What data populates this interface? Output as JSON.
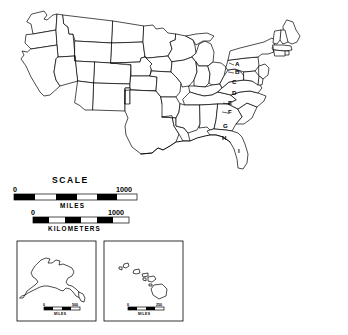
{
  "figure": {
    "background_color": "#ffffff",
    "line_color": "#000000"
  },
  "state_labels": [
    {
      "id": "A",
      "text": "A"
    },
    {
      "id": "B",
      "text": "B"
    },
    {
      "id": "C",
      "text": "C"
    },
    {
      "id": "D",
      "text": "D"
    },
    {
      "id": "E",
      "text": "E"
    },
    {
      "id": "F",
      "text": "F"
    },
    {
      "id": "G",
      "text": "G"
    },
    {
      "id": "H",
      "text": "H"
    },
    {
      "id": "I",
      "text": "I"
    }
  ],
  "scale": {
    "title": "SCALE",
    "miles": {
      "unit_label": "MILES",
      "min_label": "0",
      "max_label": "1000"
    },
    "kilometers": {
      "unit_label": "KILOMETERS",
      "min_label": "0",
      "max_label": "1000"
    }
  },
  "insets": [
    {
      "id": "alaska",
      "name": "Alaska",
      "scale": {
        "min_label": "0",
        "max_label": "500",
        "unit_label": "MILES"
      }
    },
    {
      "id": "hawaii",
      "name": "Hawaii",
      "scale": {
        "min_label": "0",
        "max_label": "250",
        "unit_label": "MILES"
      }
    }
  ]
}
